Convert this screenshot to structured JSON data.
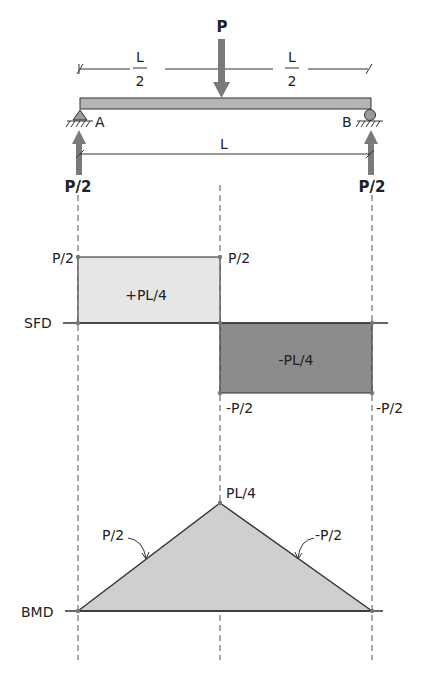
{
  "beam": {
    "load_label": "P",
    "half_span_left": {
      "num": "L",
      "den": "2"
    },
    "half_span_right": {
      "num": "L",
      "den": "2"
    },
    "span_label": "L",
    "support_a": "A",
    "support_b": "B",
    "reaction_a": "P/2",
    "reaction_b": "P/2"
  },
  "sfd": {
    "axis_label": "SFD",
    "left_top_label": "P/2",
    "mid_top_label": "P/2",
    "positive_area_label": "+PL/4",
    "negative_area_label": "-PL/4",
    "mid_bottom_label": "-P/2",
    "right_bottom_label": "-P/2"
  },
  "bmd": {
    "axis_label": "BMD",
    "peak_label": "PL/4",
    "left_slope_label": "P/2",
    "right_slope_label": "-P/2"
  },
  "colors": {
    "beam_fill": "#b5b5b5",
    "arrow": "#7a7a7a",
    "sfd_positive": "#e6e6e6",
    "sfd_negative": "#8c8c8c",
    "bmd_fill": "#cfcfcf",
    "line": "#333333"
  }
}
